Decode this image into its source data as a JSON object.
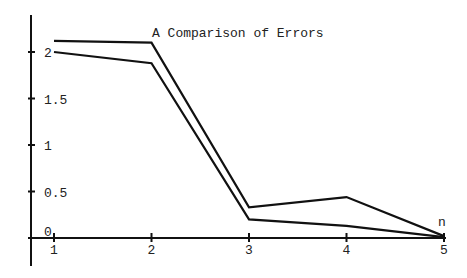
{
  "chart_data": {
    "type": "line",
    "title": "A Comparison of Errors",
    "xlabel": "n",
    "ylabel": "",
    "x": [
      1,
      2,
      3,
      4,
      5
    ],
    "x_ticks": [
      "1",
      "2",
      "3",
      "4",
      "5"
    ],
    "y_ticks": [
      "0",
      "0.5",
      "1",
      "1.5",
      "2"
    ],
    "y_tick_values": [
      0,
      0.5,
      1,
      1.5,
      2
    ],
    "xlim": [
      0.75,
      5
    ],
    "ylim": [
      -0.4,
      2.3
    ],
    "grid": false,
    "legend": null,
    "series": [
      {
        "name": "Error A (upper)",
        "values": [
          2.12,
          2.1,
          0.33,
          0.44,
          0.02
        ],
        "color": "#111111"
      },
      {
        "name": "Error B (lower)",
        "values": [
          2.0,
          1.88,
          0.2,
          0.13,
          0.01
        ],
        "color": "#111111"
      }
    ]
  }
}
